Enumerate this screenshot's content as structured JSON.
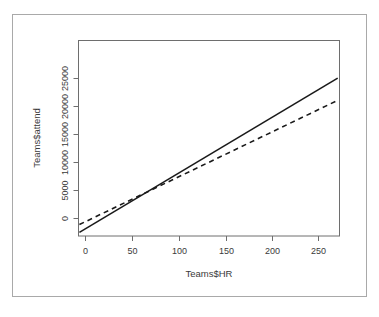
{
  "chart_data": {
    "type": "line",
    "title": "",
    "xlabel": "Teams$HR",
    "ylabel": "Teams$attend",
    "xlim": [
      -13,
      277
    ],
    "ylim": [
      -1600,
      27800
    ],
    "xticks": [
      0,
      50,
      100,
      150,
      200,
      250
    ],
    "xtick_labels": [
      "0",
      "50",
      "100",
      "150",
      "200",
      "250"
    ],
    "yticks": [
      0,
      5000,
      10000,
      15000,
      20000,
      25000
    ],
    "ytick_labels": [
      "0",
      "5000",
      "10000",
      "15000",
      "20000",
      "25000"
    ],
    "grid": false,
    "legend": null,
    "series": [
      {
        "name": "solid-regression-line",
        "style": "solid",
        "color": "#1a1a1a",
        "width": 1.6,
        "x": [
          -12,
          275
        ],
        "y": [
          -1050,
          22150
        ]
      },
      {
        "name": "dashed-regression-line",
        "style": "dashed",
        "color": "#1a1a1a",
        "width": 1.6,
        "dash": "5,4",
        "x": [
          -12,
          275
        ],
        "y": [
          120,
          18800
        ]
      }
    ]
  },
  "figure": {
    "background_color": "#ffffff",
    "frame_color": "#a9a9a9",
    "axis_color": "#6e6e6e",
    "text_color": "#3a3a3a"
  }
}
